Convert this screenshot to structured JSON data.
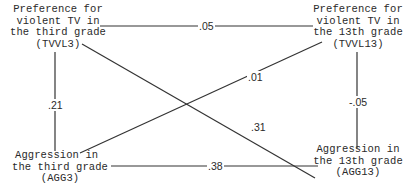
{
  "diagram": {
    "type": "cross-lagged panel",
    "nodes": {
      "tvvl3": {
        "lines": [
          "Preference for",
          "violent TV in",
          "the third grade",
          "(TVVL3)"
        ],
        "abbrev": "TVVL3"
      },
      "tvvl13": {
        "lines": [
          "Preference for",
          "violent TV in",
          "the 13th grade",
          "(TVVL13)"
        ],
        "abbrev": "TVVL13"
      },
      "agg3": {
        "lines": [
          "Aggression in",
          "the third grade",
          "(AGG3)"
        ],
        "abbrev": "AGG3"
      },
      "agg13": {
        "lines": [
          "Aggression in",
          "the 13th grade",
          "(AGG13)"
        ],
        "abbrev": "AGG13"
      }
    },
    "edges": [
      {
        "from": "TVVL3",
        "to": "TVVL13",
        "label": ".05",
        "kind": "autocorrelation"
      },
      {
        "from": "TVVL3",
        "to": "AGG3",
        "label": ".21",
        "kind": "synchronous"
      },
      {
        "from": "TVVL13",
        "to": "AGG13",
        "label": "-.05",
        "kind": "synchronous"
      },
      {
        "from": "AGG3",
        "to": "TVVL13",
        "label": ".01",
        "kind": "cross-lagged"
      },
      {
        "from": "TVVL3",
        "to": "AGG13",
        "label": ".31",
        "kind": "cross-lagged"
      },
      {
        "from": "AGG3",
        "to": "AGG13",
        "label": ".38",
        "kind": "autocorrelation"
      }
    ],
    "labels": {
      "top": ".05",
      "left": ".21",
      "right": "-.05",
      "diag_up": ".01",
      "diag_down": ".31",
      "bottom": ".38"
    }
  }
}
